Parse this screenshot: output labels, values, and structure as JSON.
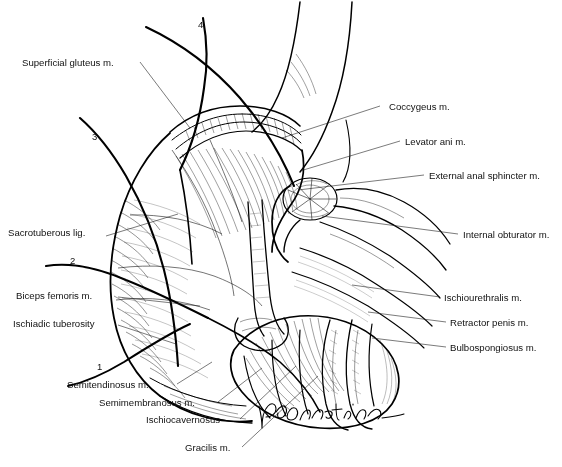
{
  "figure": {
    "signature": "G. Constantinou",
    "line_color": "#000000",
    "background_color": "#ffffff"
  },
  "labels_left": [
    {
      "id": "superficial-gluteus",
      "text": "Superficial gluteus m.",
      "x": 22,
      "y": 66
    },
    {
      "id": "sacrotuberous-lig",
      "text": "Sacrotuberous lig.",
      "x": 8,
      "y": 236
    },
    {
      "id": "biceps-femoris",
      "text": "Biceps femoris m.",
      "x": 16,
      "y": 299
    },
    {
      "id": "ischiadic-tuberosity",
      "text": "Ischiadic tuberosity",
      "x": 13,
      "y": 327
    },
    {
      "id": "semitendinosus",
      "text": "Semitendinosus m.",
      "x": 67,
      "y": 388
    },
    {
      "id": "semimembranosus",
      "text": "Semimembranosus m.",
      "x": 99,
      "y": 406
    },
    {
      "id": "ischiocavernosus",
      "text": "Ischiocavernosus",
      "x": 146,
      "y": 423
    },
    {
      "id": "gracilis",
      "text": "Gracilis m.",
      "x": 185,
      "y": 451
    }
  ],
  "labels_right": [
    {
      "id": "coccygeus",
      "text": "Coccygeus m.",
      "x": 389,
      "y": 110
    },
    {
      "id": "levator-ani",
      "text": "Levator ani m.",
      "x": 405,
      "y": 145
    },
    {
      "id": "external-anal-sphincter",
      "text": "External anal sphincter m.",
      "x": 429,
      "y": 179
    },
    {
      "id": "internal-obturator",
      "text": "Internal obturator m.",
      "x": 463,
      "y": 238
    },
    {
      "id": "ischiourethralis",
      "text": "Ischiourethralis m.",
      "x": 444,
      "y": 301
    },
    {
      "id": "retractor-penis",
      "text": "Retractor penis m.",
      "x": 450,
      "y": 326
    },
    {
      "id": "bulbospongiosus",
      "text": "Bulbospongiosus m.",
      "x": 450,
      "y": 351
    }
  ],
  "markers": [
    {
      "id": "marker-1",
      "text": "1",
      "x": 97,
      "y": 370
    },
    {
      "id": "marker-2",
      "text": "2",
      "x": 70,
      "y": 264
    },
    {
      "id": "marker-3",
      "text": "3",
      "x": 92,
      "y": 140
    },
    {
      "id": "marker-4",
      "text": "4",
      "x": 198,
      "y": 28
    }
  ]
}
